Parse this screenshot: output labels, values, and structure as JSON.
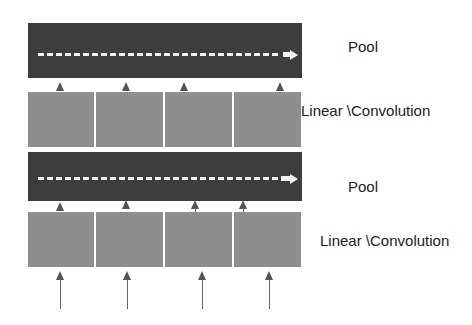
{
  "layers": [
    {
      "type": "pool",
      "label": "Pool"
    },
    {
      "type": "linear",
      "label": "Linear \\Convolution"
    },
    {
      "type": "pool",
      "label": "Pool"
    },
    {
      "type": "linear",
      "label": "Linear \\Convolution"
    }
  ],
  "blocks_per_layer": 4,
  "colors": {
    "pool": "#3d3d3d",
    "linear": "#8e8e8e",
    "arrow": "#555555",
    "dashed_arrow": "#f2f2f2"
  }
}
